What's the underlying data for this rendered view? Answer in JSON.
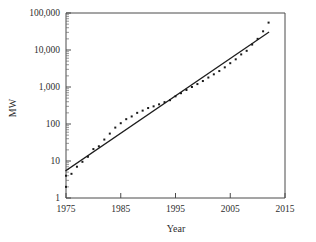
{
  "chart_data": {
    "type": "scatter",
    "title": "",
    "xlabel": "Year",
    "ylabel": "MW",
    "xlim": [
      1975,
      2015
    ],
    "ylim": [
      1,
      100000
    ],
    "yscale": "log",
    "xscale": "linear",
    "grid": false,
    "legend": null,
    "xticks": [
      1975,
      1985,
      1995,
      2005,
      2015
    ],
    "xtick_labels": [
      "1975",
      "1985",
      "1995",
      "2005",
      "2015"
    ],
    "yticks": [
      1,
      10,
      100,
      1000,
      10000,
      100000
    ],
    "ytick_labels": [
      "1",
      "10",
      "100",
      "1,000",
      "10,000",
      "100,000"
    ],
    "minor_ticks": "log-decade-subdivisions",
    "series": [
      {
        "name": "data-points",
        "marker": "square",
        "marker_size_px": 2,
        "color": "#1a1a1a",
        "x": [
          1975,
          1975,
          1976,
          1977,
          1978,
          1979,
          1980,
          1981,
          1982,
          1983,
          1984,
          1985,
          1986,
          1987,
          1988,
          1989,
          1990,
          1991,
          1992,
          1993,
          1994,
          1995,
          1996,
          1997,
          1998,
          1999,
          2000,
          2001,
          2002,
          2003,
          2004,
          2005,
          2006,
          2007,
          2008,
          2009,
          2010,
          2011,
          2012
        ],
        "y": [
          2,
          4,
          4.5,
          7,
          9.5,
          13,
          21,
          25,
          38,
          55,
          80,
          105,
          135,
          160,
          200,
          230,
          270,
          300,
          340,
          390,
          440,
          560,
          680,
          830,
          1000,
          1200,
          1450,
          1800,
          2200,
          2700,
          3400,
          4400,
          5600,
          7600,
          9500,
          14000,
          20000,
          32000,
          55000
        ]
      },
      {
        "name": "exponential-fit-line",
        "marker": "none",
        "color": "#1d1d1d",
        "x": [
          1975,
          2012
        ],
        "y": [
          5.5,
          30000
        ]
      }
    ]
  },
  "figure": {
    "axis_label_x": "Year",
    "axis_label_y": "MW"
  }
}
